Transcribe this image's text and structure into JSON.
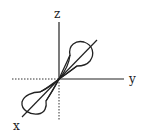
{
  "diagram": {
    "type": "3d-axes-orbital",
    "axes": {
      "x_label": "x",
      "y_label": "y",
      "z_label": "z"
    },
    "orbital": "p-orbital dumbbell along x axis",
    "colors": {
      "stroke": "#222222",
      "background": "#ffffff"
    }
  }
}
